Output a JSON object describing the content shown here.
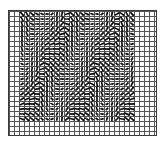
{
  "figure": {
    "name": "vector-field-quiver-plot",
    "background_color": "#ffffff",
    "frame_color": "#3a3a3a",
    "grid_color": "#555555",
    "arrow_color": "#111111"
  },
  "chart_data": {
    "type": "scatter",
    "title": "",
    "subtitle": "",
    "xlabel": "",
    "ylabel": "",
    "legend": [],
    "annotations": [],
    "grid": true,
    "legend_position": "none",
    "xlim": [
      0,
      30
    ],
    "ylim": [
      0,
      25
    ],
    "xticks": [
      0,
      5,
      10,
      15,
      20,
      25,
      30
    ],
    "yticks": [
      0,
      5,
      10,
      15,
      20,
      25
    ],
    "xtick_labels": [],
    "ytick_labels": [],
    "grid_columns": 30,
    "grid_rows": 25,
    "cell_size_px": 5,
    "field": {
      "description": "dense quiver / vector-field arrows on a regular lattice; arrow direction varies sinusoidally in x and y producing vertical wave bands",
      "data_columns": 23,
      "data_rows": 22,
      "data_origin_col": 2,
      "data_origin_row": 0,
      "arrow_length_px": 5.2,
      "arrow_head_px": 1.8,
      "angle_model": {
        "formula": "theta_deg = A*sin(kx*col + ky*row + phase) + B*cos(kx2*col)",
        "A": 62,
        "B": 26,
        "kx": 0.62,
        "ky": 0.28,
        "kx2": 1.24,
        "phase": 0.35
      },
      "magnitude_model": {
        "formula": "m = m0 + m1*cos(kx*col + ky*row)",
        "m0": 0.86,
        "m1": 0.22
      }
    }
  }
}
